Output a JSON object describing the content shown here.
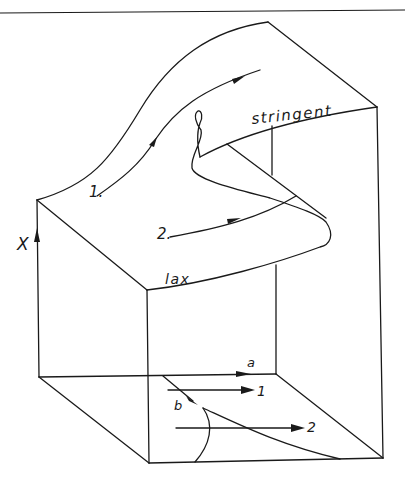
{
  "diagram": {
    "type": "cusp catastrophe surface",
    "axis_label": "X",
    "surface_labels": {
      "upper_sheet": "stringent",
      "lower_sheet": "lax"
    },
    "trajectory_labels": {
      "path_1": "1.",
      "path_2": "2."
    },
    "control_plane_labels": {
      "axis_a": "a",
      "axis_b": "b",
      "projection_1": "1",
      "projection_2": "2"
    },
    "colors": {
      "line": "#1a1a1a",
      "background": "#ffffff"
    }
  }
}
